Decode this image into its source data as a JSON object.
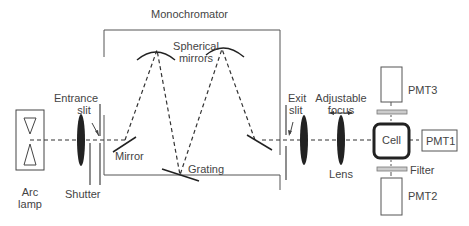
{
  "diagram": {
    "type": "optical-setup",
    "title": "Monochromator",
    "labels": {
      "monochromator": "Monochromator",
      "spherical_mirrors_1": "Spherical",
      "spherical_mirrors_2": "mirrors",
      "entrance_slit_1": "Entrance",
      "entrance_slit_2": "slit",
      "mirror": "Mirror",
      "grating": "Grating",
      "exit_slit_1": "Exit",
      "exit_slit_2": "slit",
      "adjustable_focus_1": "Adjustable",
      "adjustable_focus_2": "focus",
      "lens": "Lens",
      "cell": "Cell",
      "filter": "Filter",
      "pmt1": "PMT1",
      "pmt2": "PMT2",
      "pmt3": "PMT3",
      "shutter": "Shutter",
      "arc_lamp_1": "Arc",
      "arc_lamp_2": "lamp"
    },
    "components": [
      "Arc lamp",
      "Lens",
      "Shutter",
      "Entrance slit",
      "Mirror",
      "Spherical mirrors",
      "Grating",
      "Exit slit",
      "Lens",
      "Adjustable focus lens",
      "Cell",
      "Filter",
      "PMT1",
      "PMT2",
      "PMT3"
    ],
    "colors": {
      "line": "#333333",
      "filter": "#bbbbbb",
      "text": "#444444"
    }
  }
}
